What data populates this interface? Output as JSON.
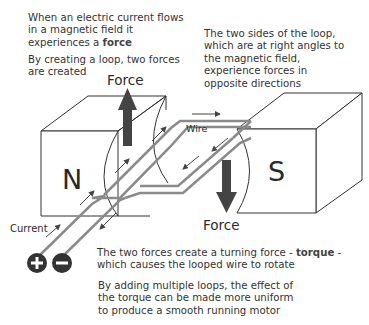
{
  "captions": {
    "top_left_1": {
      "pre": "When an electric current flows in a magnetic field it experiences a ",
      "bold": "force",
      "post": ""
    },
    "top_left_2": "By creating a loop, two forces are created",
    "top_right": "The two sides of the loop, which are at right angles to the magnetic field, experience forces in opposite directions",
    "bottom_1": {
      "pre": "The two forces create a turning force - ",
      "bold": "torque",
      "post": " - which causes the looped wire to rotate"
    },
    "bottom_2": "By adding multiple loops, the effect of the torque can be made more uniform to produce a smooth running motor"
  },
  "labels": {
    "north": "N",
    "south": "S",
    "force_up": "Force",
    "force_down": "Force",
    "wire": "Wire",
    "current": "Current",
    "positive": "+",
    "negative": "−"
  },
  "colors": {
    "wire": "#8a8a8a",
    "force_arrow": "#444444",
    "outline": "#333333",
    "terminal": "#333333"
  }
}
